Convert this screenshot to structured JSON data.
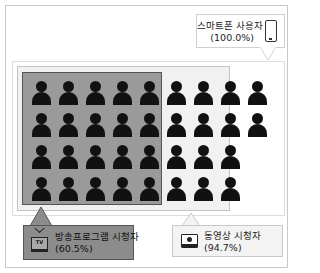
{
  "diagram": {
    "type": "venn-style nested audience diagram",
    "grid": {
      "rows": 4,
      "columns": 9,
      "tv_columns": 5,
      "video_columns": 8,
      "total_icons": 34
    },
    "rows_layout": [
      [
        1,
        1,
        1,
        1,
        1,
        1,
        1,
        1,
        1
      ],
      [
        1,
        1,
        1,
        1,
        1,
        1,
        1,
        1,
        1
      ],
      [
        1,
        1,
        1,
        1,
        1,
        1,
        1,
        1,
        0
      ],
      [
        1,
        1,
        1,
        1,
        1,
        1,
        1,
        1,
        0
      ]
    ],
    "groups": {
      "smartphone": {
        "label": "스마트폰 사용자",
        "value": "(100.0%)",
        "icon": "smartphone-icon",
        "fill": "#ffffff"
      },
      "video": {
        "label": "동영상 시청자",
        "value": "(94.7%)",
        "icon": "video-player-icon",
        "fill": "#f1f1f1"
      },
      "tv": {
        "label": "방송프로그램 시청자",
        "value": "(60.5%)",
        "icon": "tv-icon",
        "icon_text": "TV",
        "fill": "#9a9a9a"
      }
    },
    "person_icon": "person-icon"
  }
}
